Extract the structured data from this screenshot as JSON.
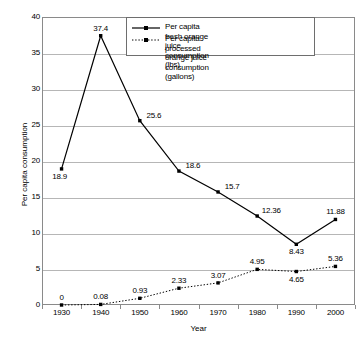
{
  "chart_data": {
    "type": "line",
    "title": "",
    "xlabel": "Year",
    "ylabel": "Per capita consumption",
    "categories": [
      "1930",
      "1940",
      "1950",
      "1960",
      "1970",
      "1980",
      "1990",
      "2000"
    ],
    "ylim": [
      0,
      40
    ],
    "ytick_step": 5,
    "yticks": [
      "0",
      "5",
      "10",
      "15",
      "20",
      "25",
      "30",
      "35",
      "40"
    ],
    "grid": "horizontal",
    "legend_position": "top-center-inside",
    "series": [
      {
        "name": "Per capita fresh orange juice consumption (lbs)",
        "style": "solid",
        "marker": "square",
        "values": [
          18.9,
          37.4,
          25.6,
          18.6,
          15.7,
          12.36,
          8.43,
          11.88
        ],
        "labels": [
          "18.9",
          "37.4",
          "25.6",
          "18.6",
          "15.7",
          "12.36",
          "8.43",
          "11.88"
        ],
        "label_positions": [
          "below-left",
          "above",
          "right",
          "right",
          "right",
          "right",
          "below",
          "above"
        ]
      },
      {
        "name": "Per capita processed orange juice consumption (gallons)",
        "style": "dotted",
        "marker": "square",
        "values": [
          0,
          0.08,
          0.93,
          2.33,
          3.07,
          4.95,
          4.65,
          5.36
        ],
        "labels": [
          "0",
          "0.08",
          "0.93",
          "2.33",
          "3.07",
          "4.95",
          "4.65",
          "5.36"
        ],
        "label_positions": [
          "above",
          "above",
          "above",
          "above",
          "above",
          "above",
          "below",
          "above"
        ]
      }
    ]
  },
  "legend": {
    "entries": [
      {
        "label": "Per capita fresh orange juice consumption (lbs)",
        "style": "solid"
      },
      {
        "label": "Per capita processed orange juice consumption\n(gallons)",
        "style": "dotted"
      }
    ]
  },
  "colors": {
    "series_line": "#000000",
    "gridline": "#b6b6b6",
    "axis": "#8a8a8a",
    "background": "#ffffff",
    "text": "#000000"
  }
}
